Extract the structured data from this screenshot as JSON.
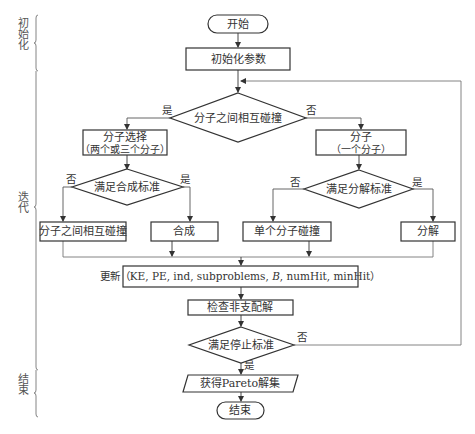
{
  "diagram": {
    "type": "flowchart",
    "title": "",
    "stages": [
      {
        "id": "init",
        "label": "初始化"
      },
      {
        "id": "iterate",
        "label": "迭代"
      },
      {
        "id": "end",
        "label": "结束"
      }
    ],
    "nodes": {
      "start": {
        "shape": "terminal",
        "label": "开始"
      },
      "init_params": {
        "shape": "process",
        "label": "初始化参数"
      },
      "collision_check": {
        "shape": "decision",
        "label": "分子之间相互碰撞"
      },
      "multi_select": {
        "shape": "process",
        "label_line1": "分子选择",
        "label_line2": "（两个或三个分子）"
      },
      "single_select": {
        "shape": "process",
        "label_line1": "分子",
        "label_line2": "（一个分子）"
      },
      "synthesis_check": {
        "shape": "decision",
        "label": "满足合成标准"
      },
      "decompose_check": {
        "shape": "decision",
        "label": "满足分解标准"
      },
      "inter_collision": {
        "shape": "process",
        "label": "分子之间相互碰撞"
      },
      "synthesis": {
        "shape": "process",
        "label": "合成"
      },
      "single_collision": {
        "shape": "process",
        "label": "单个分子碰撞"
      },
      "decompose": {
        "shape": "process",
        "label": "分解"
      },
      "update": {
        "shape": "process",
        "label_prefix": "更新（KE, PE, ind, subproblems, ",
        "label_italic": "B",
        "label_suffix": ", numHit, minHit）"
      },
      "check_nondominated": {
        "shape": "process",
        "label": "检查非支配解"
      },
      "stop_check": {
        "shape": "decision",
        "label": "满足停止标准"
      },
      "get_pareto": {
        "shape": "io",
        "label": "获得Pareto解集"
      },
      "end": {
        "shape": "terminal",
        "label": "结束"
      }
    },
    "edge_labels": {
      "collision_yes": "是",
      "collision_no": "否",
      "synthesis_no": "否",
      "synthesis_yes": "是",
      "decompose_no": "否",
      "decompose_yes": "是",
      "stop_no": "否",
      "stop_yes": "是"
    },
    "edges": [
      {
        "from": "start",
        "to": "init_params"
      },
      {
        "from": "init_params",
        "to": "collision_check"
      },
      {
        "from": "collision_check",
        "to": "multi_select",
        "label": "是"
      },
      {
        "from": "collision_check",
        "to": "single_select",
        "label": "否"
      },
      {
        "from": "multi_select",
        "to": "synthesis_check"
      },
      {
        "from": "single_select",
        "to": "decompose_check"
      },
      {
        "from": "synthesis_check",
        "to": "inter_collision",
        "label": "否"
      },
      {
        "from": "synthesis_check",
        "to": "synthesis",
        "label": "是"
      },
      {
        "from": "decompose_check",
        "to": "single_collision",
        "label": "否"
      },
      {
        "from": "decompose_check",
        "to": "decompose",
        "label": "是"
      },
      {
        "from": "inter_collision",
        "to": "update"
      },
      {
        "from": "synthesis",
        "to": "update"
      },
      {
        "from": "single_collision",
        "to": "update"
      },
      {
        "from": "decompose",
        "to": "update"
      },
      {
        "from": "update",
        "to": "check_nondominated"
      },
      {
        "from": "check_nondominated",
        "to": "stop_check"
      },
      {
        "from": "stop_check",
        "to": "collision_check",
        "label": "否"
      },
      {
        "from": "stop_check",
        "to": "get_pareto",
        "label": "是"
      },
      {
        "from": "get_pareto",
        "to": "end"
      }
    ],
    "colors": {
      "stroke": "#333333",
      "text": "#333333",
      "background": "#ffffff"
    }
  }
}
